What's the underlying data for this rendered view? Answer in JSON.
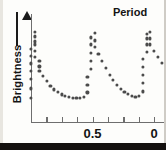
{
  "figure": {
    "ylabel": "Brightness",
    "annotation_label": "Period"
  },
  "axes": {
    "x_ticklabels": [
      {
        "text": "0.5",
        "x": 0.5
      },
      {
        "text": "0",
        "x": 1.0
      }
    ],
    "x_tick_positions": [
      0.0,
      0.125,
      0.25,
      0.375,
      0.5,
      0.625,
      0.75,
      0.875,
      1.0
    ]
  },
  "chart_data": {
    "type": "scatter",
    "title": "",
    "subtitle": "",
    "xlabel": "",
    "ylabel": "Brightness",
    "grid": false,
    "legend": null,
    "xlim": [
      0.0,
      1.08
    ],
    "ylim": [
      0.0,
      1.0
    ],
    "x_ticks": [
      0.0,
      0.125,
      0.25,
      0.375,
      0.5,
      0.625,
      0.75,
      0.875,
      1.0
    ],
    "x_ticklabels": [
      "",
      "",
      "",
      "",
      "0.5",
      "",
      "",
      "",
      "0"
    ],
    "y_ticks": [],
    "y_ticklabels": [],
    "annotations": [
      {
        "text": "Period",
        "type": "double-arrow-span",
        "x_start": 0.505,
        "x_end": 0.995,
        "y": 0.96
      }
    ],
    "marker": {
      "shape": "circle",
      "color": "#4b4b4b",
      "size": 3.2
    },
    "series": [
      {
        "name": "light curve",
        "x": [
          0.0,
          0.0,
          0.0,
          0.0,
          0.0,
          0.0,
          0.0,
          0.034,
          0.034,
          0.034,
          0.034,
          0.034,
          0.034,
          0.068,
          0.068,
          0.068,
          0.098,
          0.128,
          0.158,
          0.188,
          0.218,
          0.248,
          0.278,
          0.308,
          0.338,
          0.368,
          0.398,
          0.428,
          0.458,
          0.458,
          0.458,
          0.488,
          0.488,
          0.488,
          0.488,
          0.488,
          0.518,
          0.518,
          0.518,
          0.548,
          0.578,
          0.608,
          0.638,
          0.668,
          0.698,
          0.728,
          0.758,
          0.788,
          0.818,
          0.848,
          0.878,
          0.908,
          0.908,
          0.908,
          0.908,
          0.908,
          0.938,
          0.938,
          0.938,
          0.938,
          0.968,
          0.968,
          0.968,
          1.0,
          1.03,
          1.06
        ],
        "y": [
          0.24,
          0.33,
          0.42,
          0.5,
          0.575,
          0.65,
          0.72,
          0.79,
          0.84,
          0.88,
          0.76,
          0.7,
          0.64,
          0.6,
          0.545,
          0.5,
          0.45,
          0.4,
          0.355,
          0.32,
          0.295,
          0.27,
          0.255,
          0.245,
          0.238,
          0.235,
          0.238,
          0.25,
          0.29,
          0.36,
          0.44,
          0.52,
          0.6,
          0.68,
          0.76,
          0.83,
          0.87,
          0.8,
          0.74,
          0.67,
          0.6,
          0.53,
          0.465,
          0.41,
          0.365,
          0.325,
          0.295,
          0.272,
          0.255,
          0.248,
          0.255,
          0.3,
          0.38,
          0.46,
          0.54,
          0.62,
          0.69,
          0.76,
          0.82,
          0.86,
          0.88,
          0.82,
          0.76,
          0.7,
          0.64,
          0.58
        ]
      }
    ]
  }
}
